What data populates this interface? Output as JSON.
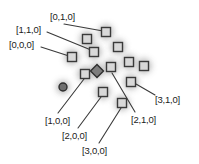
{
  "figure": {
    "background_color": "#ffffff",
    "node_fill_color": "#d8d8d8",
    "node_stroke_color": "#3a3a3a",
    "leader_line_color": "#3a3a3a",
    "shadow_color": "#b4b4b4",
    "text_color": "#1b1b1b"
  },
  "labels": [
    {
      "id": "l-0-1-0",
      "text": "[0,1,0]",
      "x": 50,
      "y": 12
    },
    {
      "id": "l-1-1-0",
      "text": "[1,1,0]",
      "x": 16,
      "y": 25
    },
    {
      "id": "l-0-0-0",
      "text": "[0,0,0]",
      "x": 9,
      "y": 40
    },
    {
      "id": "l-3-1-0",
      "text": "[3,1,0]",
      "x": 155,
      "y": 95
    },
    {
      "id": "l-2-1-0",
      "text": "[2,1,0]",
      "x": 131,
      "y": 115
    },
    {
      "id": "l-1-0-0",
      "text": "[1,0,0]",
      "x": 45,
      "y": 116
    },
    {
      "id": "l-2-0-0",
      "text": "[2,0,0]",
      "x": 62,
      "y": 131
    },
    {
      "id": "l-3-0-0",
      "text": "[3,0,0]",
      "x": 82,
      "y": 146
    }
  ],
  "nodes": [
    {
      "id": "n1",
      "shape": "square",
      "x": 106,
      "y": 32,
      "size": 9
    },
    {
      "id": "n2",
      "shape": "square",
      "x": 87,
      "y": 39,
      "size": 9
    },
    {
      "id": "n3",
      "shape": "square",
      "x": 118,
      "y": 47,
      "size": 9
    },
    {
      "id": "n4",
      "shape": "square",
      "x": 94,
      "y": 52,
      "size": 9
    },
    {
      "id": "n5",
      "shape": "square",
      "x": 72,
      "y": 57,
      "size": 9
    },
    {
      "id": "n6",
      "shape": "square",
      "x": 129,
      "y": 62,
      "size": 9
    },
    {
      "id": "n7",
      "shape": "square",
      "x": 144,
      "y": 66,
      "size": 9
    },
    {
      "id": "n8",
      "shape": "square",
      "x": 111,
      "y": 67,
      "size": 9
    },
    {
      "id": "n9",
      "shape": "diamond",
      "x": 97,
      "y": 71,
      "size": 9
    },
    {
      "id": "n10",
      "shape": "square",
      "x": 85,
      "y": 74,
      "size": 9
    },
    {
      "id": "n11",
      "shape": "square",
      "x": 131,
      "y": 82,
      "size": 9
    },
    {
      "id": "n12",
      "shape": "circle",
      "x": 63,
      "y": 87,
      "size": 8
    },
    {
      "id": "n13",
      "shape": "square",
      "x": 103,
      "y": 92,
      "size": 9
    },
    {
      "id": "n14",
      "shape": "square",
      "x": 122,
      "y": 103,
      "size": 9
    }
  ],
  "leaders": [
    {
      "id": "ld-0-1-0",
      "from_label": "[0,1,0]",
      "to_node": "n1",
      "x1": 64,
      "y1": 24,
      "x2": 103,
      "y2": 31
    },
    {
      "id": "ld-1-1-0",
      "from_label": "[1,1,0]",
      "to_node": "n4",
      "x1": 47,
      "y1": 32,
      "x2": 91,
      "y2": 50
    },
    {
      "id": "ld-0-0-0",
      "from_label": "[0,0,0]",
      "to_node": "n5",
      "x1": 41,
      "y1": 47,
      "x2": 69,
      "y2": 56
    },
    {
      "id": "ld-3-1-0",
      "from_label": "[3,1,0]",
      "to_node": "n11",
      "x1": 155,
      "y1": 95,
      "x2": 136,
      "y2": 84
    },
    {
      "id": "ld-2-1-0",
      "from_label": "[2,1,0]",
      "to_node": "n8",
      "x1": 135,
      "y1": 112,
      "x2": 112,
      "y2": 73
    },
    {
      "id": "ld-1-0-0",
      "from_label": "[1,0,0]",
      "to_node": "n10",
      "x1": 58,
      "y1": 113,
      "x2": 84,
      "y2": 79
    },
    {
      "id": "ld-2-0-0",
      "from_label": "[2,0,0]",
      "to_node": "n13",
      "x1": 78,
      "y1": 128,
      "x2": 101,
      "y2": 97
    },
    {
      "id": "ld-3-0-0",
      "from_label": "[3,0,0]",
      "to_node": "n14",
      "x1": 99,
      "y1": 143,
      "x2": 121,
      "y2": 108
    }
  ]
}
